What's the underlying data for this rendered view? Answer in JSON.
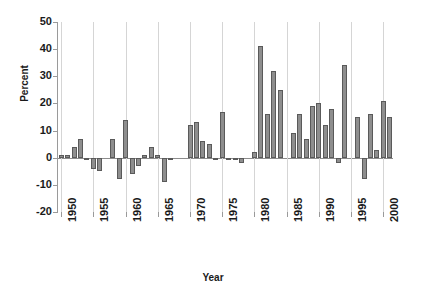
{
  "chart_data": {
    "type": "bar",
    "title": "",
    "xlabel": "Year",
    "ylabel": "Percent",
    "ylim": [
      -20,
      50
    ],
    "xlim": [
      1949.5,
      2001.5
    ],
    "grid": "vertical-only",
    "legend": "none",
    "bar_color": "#8e8e8e",
    "bar_edge_color": "#5a5a5a",
    "y_ticks": [
      50,
      40,
      30,
      20,
      10,
      0,
      -10,
      -20
    ],
    "y_tick_labels": [
      "50",
      "40",
      "30",
      "20",
      "10",
      "0",
      "-10",
      "-20"
    ],
    "x_ticks": [
      1950,
      1955,
      1960,
      1965,
      1970,
      1975,
      1980,
      1985,
      1990,
      1995,
      2000
    ],
    "x_tick_labels": [
      "1950",
      "1955",
      "1960",
      "1965",
      "1970",
      "1975",
      "1980",
      "1985",
      "1990",
      "1995",
      "2000"
    ],
    "categories": [
      1950,
      1951,
      1952,
      1953,
      1954,
      1955,
      1956,
      1957,
      1958,
      1959,
      1960,
      1961,
      1962,
      1963,
      1964,
      1965,
      1966,
      1967,
      1968,
      1969,
      1970,
      1971,
      1972,
      1973,
      1974,
      1975,
      1976,
      1977,
      1978,
      1979,
      1980,
      1981,
      1982,
      1983,
      1984,
      1985,
      1986,
      1987,
      1988,
      1989,
      1990,
      1991,
      1992,
      1993,
      1994,
      1995,
      1996,
      1997,
      1998,
      1999,
      2000,
      2001
    ],
    "values": [
      1,
      1,
      4,
      7,
      -1,
      -4,
      -5,
      0,
      7,
      -8,
      14,
      -6,
      -3,
      1,
      4,
      1,
      -9,
      -1,
      0,
      0,
      12,
      13,
      6,
      5,
      -1,
      17,
      -1,
      -1,
      -2,
      0,
      2,
      41,
      16,
      32,
      25,
      0,
      9,
      16,
      7,
      19,
      20,
      12,
      18,
      -2,
      34,
      0,
      15,
      -8,
      16,
      3,
      21,
      15
    ]
  }
}
